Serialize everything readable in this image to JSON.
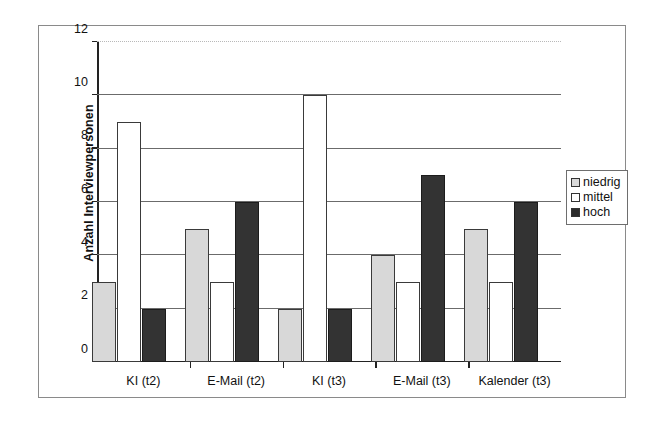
{
  "chart_data": {
    "type": "bar",
    "title": "",
    "xlabel": "",
    "ylabel": "Anzahl Interviewpersonen",
    "ylim": [
      0,
      12
    ],
    "yticks": [
      0,
      2,
      4,
      6,
      8,
      10,
      12
    ],
    "grid": true,
    "legend_position": "right",
    "categories": [
      "KI (t2)",
      "E-Mail (t2)",
      "KI (t3)",
      "E-Mail (t3)",
      "Kalender (t3)"
    ],
    "series": [
      {
        "name": "niedrig",
        "color": "#d8d8d8",
        "values": [
          3,
          5,
          2,
          4,
          5
        ]
      },
      {
        "name": "mittel",
        "color": "#ffffff",
        "values": [
          9,
          3,
          10,
          3,
          3
        ]
      },
      {
        "name": "hoch",
        "color": "#333333",
        "values": [
          2,
          6,
          2,
          7,
          6
        ]
      }
    ]
  },
  "axis": {
    "y_title": "Anzahl Interviewpersonen",
    "y_tick_labels": [
      "0",
      "2",
      "4",
      "6",
      "8",
      "10",
      "12"
    ]
  },
  "legend": {
    "items": [
      {
        "label": "niedrig"
      },
      {
        "label": "mittel"
      },
      {
        "label": "hoch"
      }
    ]
  }
}
